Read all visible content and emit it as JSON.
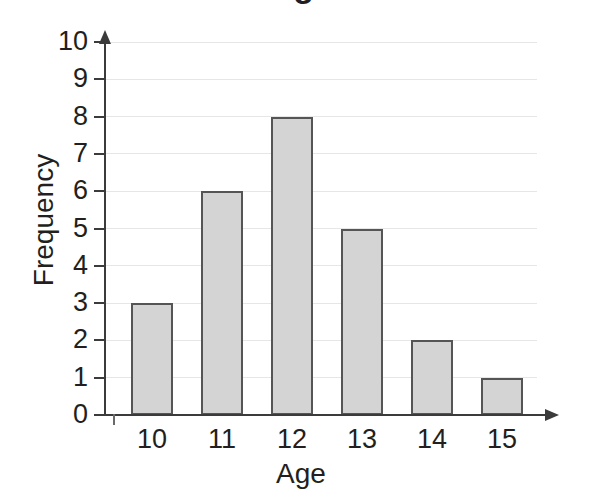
{
  "chart_data": {
    "type": "bar",
    "title": "",
    "title_fragment": "Age",
    "categories": [
      "10",
      "11",
      "12",
      "13",
      "14",
      "15"
    ],
    "values": [
      3,
      6,
      8,
      5,
      2,
      1
    ],
    "xlabel": "Age",
    "ylabel": "Frequency",
    "ylim": [
      0,
      10
    ],
    "y_ticks": [
      "10",
      "9",
      "8",
      "7",
      "6",
      "5",
      "4",
      "3",
      "2",
      "1",
      "0"
    ],
    "grid": true,
    "legend": "none",
    "bar_fill_color": "#d4d4d4",
    "bar_border_color": "#555555",
    "gridline_color": "#e6e6e6",
    "axis_color": "#3b3b3b",
    "text_color": "#231f20",
    "background_color": "#ffffff"
  }
}
